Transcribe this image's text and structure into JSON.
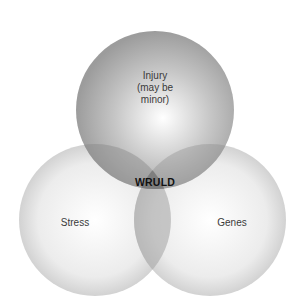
{
  "diagram": {
    "type": "venn",
    "sets": [
      {
        "id": "injury",
        "label_lines": [
          "Injury",
          "(may be",
          "minor)"
        ]
      },
      {
        "id": "stress",
        "label": "Stress"
      },
      {
        "id": "genes",
        "label": "Genes"
      }
    ],
    "intersection": {
      "sets": [
        "injury",
        "stress",
        "genes"
      ],
      "label": "WRULD"
    },
    "colors": {
      "circle_edge": "#cfcfcf",
      "circle_center": "#ffffff",
      "top_edge": "#9a9a9a",
      "overlap": "#8a8a8a",
      "core": "#707070"
    }
  }
}
